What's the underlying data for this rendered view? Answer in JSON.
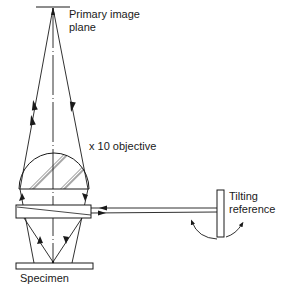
{
  "diagram": {
    "colors": {
      "line": "#1a1a1a",
      "background": "#ffffff"
    },
    "labels": {
      "primary_image_plane_line1": "Primary image",
      "primary_image_plane_line2": "plane",
      "objective": "x 10 objective",
      "tilting_reference_line1": "Tilting",
      "tilting_reference_line2": "reference",
      "specimen": "Specimen"
    },
    "components": [
      {
        "id": "primary-image-plane",
        "shape": "line",
        "x1": 36,
        "y1": 7,
        "x2": 70,
        "y2": 7
      },
      {
        "id": "optical-axis",
        "shape": "dash-dot-line",
        "x1": 53,
        "y1": 7,
        "x2": 53,
        "y2": 263
      },
      {
        "id": "objective-lens",
        "shape": "hatched-dome",
        "cx": 54,
        "base_y": 189,
        "top_y": 153,
        "half_width": 35
      },
      {
        "id": "glass-plate",
        "shape": "rect",
        "x": 16,
        "y": 205,
        "w": 75,
        "h": 13
      },
      {
        "id": "specimen",
        "shape": "rect",
        "x": 16,
        "y": 263,
        "w": 77,
        "h": 6
      },
      {
        "id": "tilting-reference",
        "shape": "rect",
        "x": 217,
        "y": 190,
        "w": 7,
        "h": 47
      }
    ],
    "rays": [
      {
        "id": "ray-left-up",
        "from": [
          53,
          263
        ],
        "to": [
          20,
          189
        ],
        "continues_to": [
          53,
          7
        ],
        "direction": "up"
      },
      {
        "id": "ray-right-down",
        "from": [
          53,
          7
        ],
        "to": [
          88,
          189
        ],
        "continues_to": [
          53,
          263
        ],
        "direction": "down"
      },
      {
        "id": "beam-from-reference",
        "from": [
          217,
          207
        ],
        "to": [
          91,
          207
        ],
        "direction": "left"
      },
      {
        "id": "beam-to-reference",
        "from": [
          91,
          213
        ],
        "to": [
          217,
          213
        ],
        "direction": "right"
      }
    ]
  }
}
